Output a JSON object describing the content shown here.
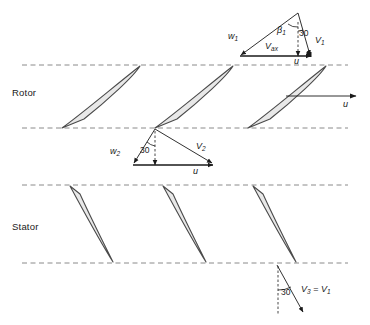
{
  "figure": {
    "kind": "turbomachinery-velocity-triangle-diagram",
    "width": 370,
    "height": 325,
    "background": "#ffffff",
    "line_color": "#1a1a1a",
    "dashed_color": "#8a8a8a",
    "blade_fill": "#e8e8e8",
    "blade_stroke": "#4a4a4a"
  },
  "stages": {
    "rotor_label": "Rotor",
    "stator_label": "Stator"
  },
  "triangle_inlet": {
    "w_label": "w",
    "w_sub": "1",
    "v_label": "V",
    "v_sub": "1",
    "vax_label": "V",
    "vax_sub": "ax",
    "u_label": "u",
    "beta_label": "β",
    "beta_sub": "1",
    "angle_value": "30"
  },
  "triangle_exit": {
    "w_label": "w",
    "w_sub": "2",
    "v_label": "V",
    "v_sub": "2",
    "u_label": "u",
    "angle_value": "30"
  },
  "rotor_speed": {
    "u_label": "u"
  },
  "stator_exit": {
    "angle_value": "30",
    "v3_label": "V",
    "v3_sub": "3",
    "equals": " = ",
    "v1_label": "V",
    "v1_sub": "1"
  },
  "geometry": {
    "dashed_lines_y": [
      65,
      128,
      185,
      263
    ],
    "rotor_blade_bases_x": [
      62,
      155,
      248
    ],
    "stator_blade_tops_x": [
      70,
      163,
      253
    ]
  }
}
